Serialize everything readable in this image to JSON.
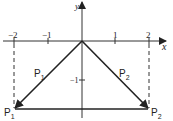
{
  "diagram": {
    "type": "coordinate-vector-diagram",
    "axes": {
      "x_label": "x",
      "y_label": "y",
      "x_ticks": [
        {
          "value": -2,
          "label": "−2"
        },
        {
          "value": -1,
          "label": "−1"
        },
        {
          "value": 1,
          "label": "1"
        },
        {
          "value": 2,
          "label": "2"
        }
      ],
      "y_ticks": [
        {
          "value": -1,
          "label": "−1"
        }
      ]
    },
    "vectors": [
      {
        "name": "P1",
        "label_main": "P",
        "label_sub": "1",
        "from": [
          0,
          0
        ],
        "to": [
          -2,
          -2
        ]
      },
      {
        "name": "P2",
        "label_main": "P",
        "label_sub": "2",
        "from": [
          0,
          0
        ],
        "to": [
          2,
          -2
        ]
      }
    ],
    "points": [
      {
        "name": "P1",
        "label_main": "P",
        "label_sub": "1",
        "coords": [
          -2,
          -2
        ]
      },
      {
        "name": "P2",
        "label_main": "P",
        "label_sub": "2",
        "coords": [
          2,
          -2
        ]
      }
    ],
    "connector": {
      "from": "P1",
      "to": "P2",
      "style": "solid"
    },
    "guides": [
      {
        "x": -2,
        "style": "dashed"
      },
      {
        "x": 2,
        "style": "dashed"
      }
    ],
    "colors": {
      "ink": "#222222",
      "background": "#ffffff"
    }
  }
}
